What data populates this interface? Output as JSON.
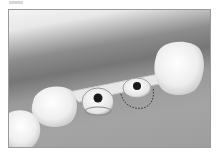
{
  "figure": {
    "label_placeholder": "",
    "colors": {
      "gum": "#9a9a9a",
      "tissue_dark": "#767676",
      "tooth": "#f2f2f2",
      "implant_hole": "#1a1a1a",
      "dotted_outline": "#333333"
    }
  }
}
